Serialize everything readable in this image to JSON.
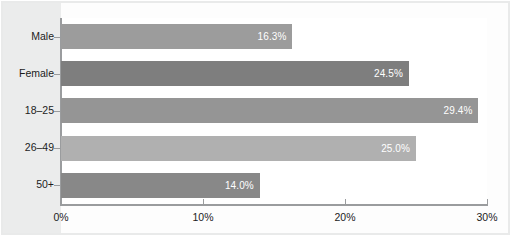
{
  "chart_data": {
    "type": "bar",
    "orientation": "horizontal",
    "title": "",
    "subtitle": "",
    "xlabel": "",
    "ylabel": "",
    "xlim": [
      0,
      30
    ],
    "grid": false,
    "legend": false,
    "legend_position": "none",
    "categories": [
      "Male",
      "Female",
      "18–25",
      "26–49",
      "50+"
    ],
    "values": [
      16.3,
      24.5,
      29.4,
      25.0,
      14.0
    ],
    "value_labels": [
      "16.3%",
      "24.5%",
      "29.4%",
      "25.0%",
      "14.0%"
    ],
    "xtick_values": [
      0,
      10,
      20,
      30
    ],
    "xtick_labels": [
      "0%",
      "10%",
      "20%",
      "30%"
    ],
    "bar_colors": [
      "#9c9c9c",
      "#7e7e7e",
      "#959595",
      "#b0b0b0",
      "#888888"
    ],
    "value_label_color": "#ffffff",
    "axis_color": "#9a9c9e",
    "plot_background": "#ffffff",
    "figure_background": "#fdfdfd",
    "gutter_background": "#ebecec"
  }
}
